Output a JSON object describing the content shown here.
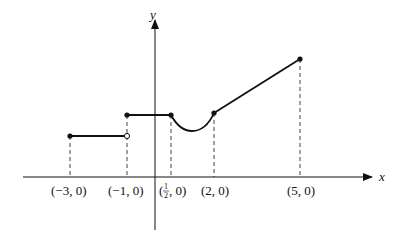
{
  "diagram": {
    "type": "piecewise-function-graph",
    "axes": {
      "x_label": "x",
      "y_label": "y"
    },
    "tick_labels": [
      {
        "id": "neg3",
        "text": "(−3, 0)"
      },
      {
        "id": "neg1",
        "text": "(−1, 0)"
      },
      {
        "id": "half",
        "prefix": "(",
        "num": "1",
        "den": "2",
        "suffix": ", 0)"
      },
      {
        "id": "two",
        "text": "(2, 0)"
      },
      {
        "id": "five",
        "text": "(5, 0)"
      }
    ],
    "segments": [
      {
        "name": "constant-low",
        "from_x": -3,
        "to_x": -1,
        "left_closed": true,
        "right_closed": false
      },
      {
        "name": "constant-high",
        "from_x": -1,
        "to_x": 0.5,
        "left_closed": true,
        "right_closed": true
      },
      {
        "name": "concave-up-curve",
        "from_x": 0.5,
        "to_x": 2
      },
      {
        "name": "linear-rise",
        "from_x": 2,
        "to_x": 5,
        "left_closed": true,
        "right_closed": true
      }
    ],
    "colors": {
      "stroke": "#111111",
      "background": "#ffffff"
    }
  }
}
